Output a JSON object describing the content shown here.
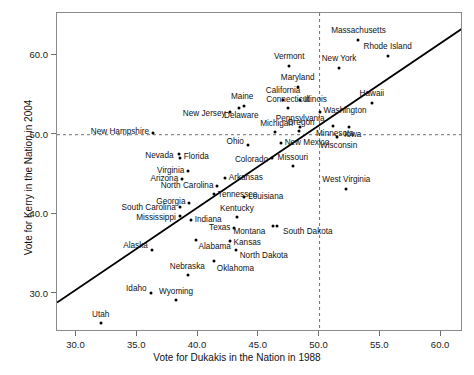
{
  "chart_data": {
    "type": "scatter",
    "title": "",
    "xlabel": "Vote for Dukakis in the Nation in 1988",
    "ylabel": "Vote for Kerry in the Nation in 2004",
    "xlim": [
      28.4,
      61.8
    ],
    "ylim": [
      25.2,
      65.3
    ],
    "xticks": [
      "30.0",
      "35.0",
      "40.0",
      "45.0",
      "50.0",
      "55.0",
      "60.0"
    ],
    "xtick_values": [
      30.0,
      35.0,
      40.0,
      45.0,
      50.0,
      55.0,
      60.0
    ],
    "yticks": [
      "30.0",
      "40.0",
      "50.0",
      "60.0"
    ],
    "ytick_values": [
      30.0,
      40.0,
      50.0,
      60.0
    ],
    "grid": false,
    "legend": "none",
    "reference_lines": [
      {
        "name": "vertical-50-reference",
        "orientation": "vertical",
        "value": 50.0,
        "style": "dashed"
      },
      {
        "name": "horizontal-50-reference",
        "orientation": "horizontal",
        "value": 50.0,
        "style": "dashed"
      }
    ],
    "fit_line": {
      "name": "regression-line",
      "style": "solid",
      "x1": 28.4,
      "y1": 28.9,
      "x2": 61.8,
      "y2": 63.4
    },
    "point_label_colors": {
      "point": "#000000",
      "label": "#111111"
    },
    "points": [
      {
        "label": "Massachusetts",
        "x": 53.2,
        "y": 61.9,
        "side": "c",
        "dx": 0,
        "dy": -9
      },
      {
        "label": "Rhode Island",
        "x": 55.6,
        "y": 59.9,
        "side": "c",
        "dx": 0,
        "dy": -9
      },
      {
        "label": "New York",
        "x": 51.6,
        "y": 58.4,
        "side": "c",
        "dx": 0,
        "dy": -9
      },
      {
        "label": "Vermont",
        "x": 47.5,
        "y": 58.6,
        "side": "c",
        "dx": 0,
        "dy": -9
      },
      {
        "label": "Maryland",
        "x": 48.2,
        "y": 56.0,
        "side": "c",
        "dx": 0,
        "dy": -9
      },
      {
        "label": "California",
        "x": 47.0,
        "y": 54.4,
        "side": "c",
        "dx": 0,
        "dy": -9
      },
      {
        "label": "Illinois",
        "x": 48.4,
        "y": 54.4,
        "side": "r",
        "dx": 4,
        "dy": 0
      },
      {
        "label": "Hawaii",
        "x": 54.3,
        "y": 54.0,
        "side": "c",
        "dx": 0,
        "dy": -9
      },
      {
        "label": "Maine",
        "x": 43.8,
        "y": 53.6,
        "side": "c",
        "dx": -2,
        "dy": -9
      },
      {
        "label": "Delaware",
        "x": 43.4,
        "y": 53.3,
        "side": "c",
        "dx": 2,
        "dy": 8
      },
      {
        "label": "Connecticut",
        "x": 47.4,
        "y": 53.4,
        "side": "c",
        "dx": 0,
        "dy": -8
      },
      {
        "label": "Washington",
        "x": 50.0,
        "y": 52.8,
        "side": "r",
        "dx": 4,
        "dy": -1
      },
      {
        "label": "New Jersey",
        "x": 42.6,
        "y": 52.9,
        "side": "l",
        "dx": -4,
        "dy": 2
      },
      {
        "label": "Pennsylvania",
        "x": 48.4,
        "y": 51.0,
        "side": "c",
        "dx": 0,
        "dy": -8
      },
      {
        "label": "New Hampshire",
        "x": 36.3,
        "y": 50.2,
        "side": "l",
        "dx": -4,
        "dy": -1
      },
      {
        "label": "Michigan",
        "x": 46.3,
        "y": 50.3,
        "side": "c",
        "dx": 2,
        "dy": -8
      },
      {
        "label": "Oregon",
        "x": 48.3,
        "y": 50.5,
        "side": "c",
        "dx": 2,
        "dy": -8
      },
      {
        "label": "Minnesota",
        "x": 51.1,
        "y": 51.1,
        "side": "c",
        "dx": 2,
        "dy": 8
      },
      {
        "label": "Iowa",
        "x": 52.4,
        "y": 51.0,
        "side": "c",
        "dx": 4,
        "dy": 8
      },
      {
        "label": "Ohio",
        "x": 44.1,
        "y": 48.7,
        "side": "l",
        "dx": -4,
        "dy": -3
      },
      {
        "label": "New Mexico",
        "x": 46.8,
        "y": 49.0,
        "side": "r",
        "dx": 4,
        "dy": 0
      },
      {
        "label": "Wisconsin",
        "x": 51.4,
        "y": 49.7,
        "side": "c",
        "dx": 2,
        "dy": 9
      },
      {
        "label": "Florida",
        "x": 38.5,
        "y": 47.1,
        "side": "r",
        "dx": 4,
        "dy": -1
      },
      {
        "label": "Nevada",
        "x": 38.4,
        "y": 47.6,
        "side": "l",
        "dx": -5,
        "dy": 2
      },
      {
        "label": "Colorado",
        "x": 46.1,
        "y": 47.1,
        "side": "l",
        "dx": -4,
        "dy": 2
      },
      {
        "label": "Missouri",
        "x": 47.8,
        "y": 46.1,
        "side": "c",
        "dx": 0,
        "dy": -8
      },
      {
        "label": "Virginia",
        "x": 39.2,
        "y": 45.5,
        "side": "l",
        "dx": -4,
        "dy": 0
      },
      {
        "label": "Arizona",
        "x": 38.7,
        "y": 44.4,
        "side": "l",
        "dx": -4,
        "dy": 0
      },
      {
        "label": "Arkansas",
        "x": 42.2,
        "y": 44.5,
        "side": "r",
        "dx": 4,
        "dy": 0
      },
      {
        "label": "North Carolina",
        "x": 41.6,
        "y": 43.6,
        "side": "l",
        "dx": -4,
        "dy": 0
      },
      {
        "label": "West Virginia",
        "x": 52.2,
        "y": 43.2,
        "side": "c",
        "dx": 0,
        "dy": -9
      },
      {
        "label": "Louisiana",
        "x": 43.8,
        "y": 42.2,
        "side": "r",
        "dx": 4,
        "dy": 0
      },
      {
        "label": "Georgia",
        "x": 39.3,
        "y": 41.4,
        "side": "l",
        "dx": -4,
        "dy": -1
      },
      {
        "label": "Tennessee",
        "x": 41.3,
        "y": 42.5,
        "side": "r",
        "dx": 4,
        "dy": 1
      },
      {
        "label": "South Carolina",
        "x": 38.5,
        "y": 40.9,
        "side": "l",
        "dx": -4,
        "dy": 1
      },
      {
        "label": "Kentucky",
        "x": 43.2,
        "y": 39.7,
        "side": "c",
        "dx": 0,
        "dy": -8
      },
      {
        "label": "Indiana",
        "x": 39.4,
        "y": 39.3,
        "side": "r",
        "dx": 4,
        "dy": 0
      },
      {
        "label": "Mississippi",
        "x": 38.5,
        "y": 39.8,
        "side": "l",
        "dx": -4,
        "dy": 2
      },
      {
        "label": "Texas",
        "x": 43.0,
        "y": 38.3,
        "side": "l",
        "dx": -4,
        "dy": 0
      },
      {
        "label": "South Dakota",
        "x": 46.5,
        "y": 38.5,
        "side": "r",
        "dx": 6,
        "dy": 6
      },
      {
        "label": "Montana",
        "x": 46.2,
        "y": 38.5,
        "side": "l",
        "dx": -8,
        "dy": 6
      },
      {
        "label": "Alaska",
        "x": 36.2,
        "y": 35.5,
        "side": "l",
        "dx": -4,
        "dy": -4
      },
      {
        "label": "Kansas",
        "x": 42.6,
        "y": 36.6,
        "side": "r",
        "dx": 4,
        "dy": 2
      },
      {
        "label": "Alabama",
        "x": 39.8,
        "y": 36.8,
        "side": "r",
        "dx": 3,
        "dy": 7
      },
      {
        "label": "North Dakota",
        "x": 43.1,
        "y": 35.5,
        "side": "r",
        "dx": 4,
        "dy": 6
      },
      {
        "label": "Nebraska",
        "x": 39.2,
        "y": 32.4,
        "side": "c",
        "dx": -1,
        "dy": -8
      },
      {
        "label": "Oklahoma",
        "x": 41.3,
        "y": 34.1,
        "side": "r",
        "dx": 3,
        "dy": 8
      },
      {
        "label": "Idaho",
        "x": 36.1,
        "y": 30.1,
        "side": "l",
        "dx": -4,
        "dy": -4
      },
      {
        "label": "Wyoming",
        "x": 38.2,
        "y": 29.2,
        "side": "c",
        "dx": 0,
        "dy": -8
      },
      {
        "label": "Utah",
        "x": 32.0,
        "y": 26.3,
        "side": "c",
        "dx": 0,
        "dy": -8
      }
    ]
  }
}
